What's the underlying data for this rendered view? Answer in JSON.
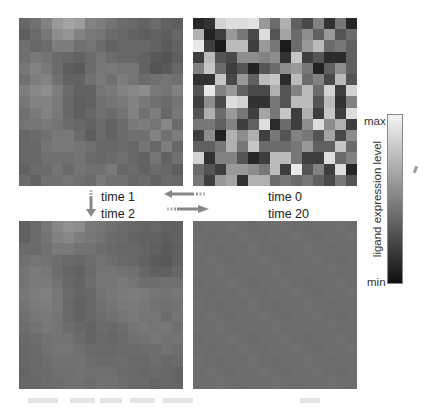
{
  "figure": {
    "panels": [
      {
        "id": "t1",
        "label": "time 1",
        "position": "top-left"
      },
      {
        "id": "t0",
        "label": "time 0",
        "position": "top-right"
      },
      {
        "id": "t2",
        "label": "time 2",
        "position": "bottom-left"
      },
      {
        "id": "t20",
        "label": "time 20",
        "position": "bottom-right"
      }
    ],
    "labels": {
      "t1": "time 1",
      "t0": "time 0",
      "t2": "time 2",
      "t20": "time 20"
    },
    "arrows": [
      {
        "from": "time 0",
        "to": "time 1",
        "direction": "left"
      },
      {
        "from": "time 1",
        "to": "time 2",
        "direction": "down"
      },
      {
        "from": "time 2",
        "to": "time 20",
        "direction": "right"
      }
    ],
    "colorbar": {
      "title": "ligand expression level",
      "max_label": "max",
      "min_label": "min",
      "colormap": "grayscale",
      "max_color": "#f4f4f4",
      "min_color": "#101010"
    },
    "grid_size": [
      15,
      15
    ],
    "grids": {
      "t0": [
        [
          0.1,
          0.15,
          0.85,
          0.9,
          0.9,
          0.92,
          0.6,
          0.4,
          0.7,
          0.35,
          0.25,
          0.5,
          0.15,
          0.45,
          0.1
        ],
        [
          0.7,
          0.08,
          0.2,
          0.6,
          0.45,
          0.25,
          0.9,
          0.3,
          0.65,
          0.4,
          0.55,
          0.35,
          0.6,
          0.3,
          0.4
        ],
        [
          0.95,
          0.2,
          0.05,
          0.75,
          0.75,
          0.2,
          0.6,
          0.45,
          0.05,
          0.4,
          0.6,
          0.75,
          0.4,
          0.45,
          0.35
        ],
        [
          0.2,
          0.75,
          0.3,
          0.25,
          0.55,
          0.55,
          0.5,
          0.55,
          0.15,
          0.8,
          0.2,
          0.3,
          0.12,
          0.12,
          0.35
        ],
        [
          0.5,
          0.8,
          0.4,
          0.2,
          0.3,
          0.08,
          0.3,
          0.4,
          0.55,
          0.6,
          0.45,
          0.08,
          0.35,
          0.55,
          0.35
        ],
        [
          0.15,
          0.15,
          0.8,
          0.25,
          0.6,
          0.35,
          0.75,
          0.8,
          0.12,
          0.75,
          0.4,
          0.5,
          0.25,
          0.75,
          0.3
        ],
        [
          0.3,
          0.95,
          0.5,
          0.6,
          0.35,
          0.25,
          0.25,
          0.7,
          0.3,
          0.5,
          0.75,
          0.4,
          0.85,
          0.2,
          0.85
        ],
        [
          0.2,
          0.55,
          0.25,
          0.9,
          0.85,
          0.15,
          0.15,
          0.45,
          0.3,
          0.75,
          0.75,
          0.3,
          0.75,
          0.15,
          0.5
        ],
        [
          0.3,
          0.7,
          0.4,
          0.6,
          0.45,
          0.2,
          0.65,
          0.45,
          0.8,
          0.2,
          0.7,
          0.2,
          0.8,
          0.2,
          0.9
        ],
        [
          0.45,
          0.45,
          0.35,
          0.5,
          0.2,
          0.35,
          0.9,
          0.12,
          0.4,
          0.2,
          0.55,
          0.9,
          0.55,
          0.7,
          0.2
        ],
        [
          0.2,
          0.55,
          0.08,
          0.7,
          0.55,
          0.7,
          0.2,
          0.45,
          0.3,
          0.5,
          0.45,
          0.3,
          0.65,
          0.25,
          0.55
        ],
        [
          0.35,
          0.35,
          0.45,
          0.7,
          0.45,
          0.8,
          0.4,
          0.4,
          0.4,
          0.45,
          0.6,
          0.35,
          0.35,
          0.8,
          0.4
        ],
        [
          0.85,
          0.15,
          0.5,
          0.5,
          0.3,
          0.1,
          0.2,
          0.75,
          0.75,
          0.45,
          0.2,
          0.2,
          0.9,
          0.4,
          0.5
        ],
        [
          0.4,
          0.3,
          0.2,
          0.6,
          0.6,
          0.55,
          0.45,
          0.75,
          0.2,
          0.95,
          0.3,
          0.5,
          0.2,
          0.9,
          0.1
        ],
        [
          0.45,
          0.2,
          0.6,
          0.65,
          0.15,
          0.7,
          0.7,
          0.4,
          0.45,
          0.4,
          0.45,
          0.35,
          0.25,
          0.45,
          0.3
        ]
      ],
      "t1": [
        [
          0.38,
          0.42,
          0.5,
          0.6,
          0.65,
          0.62,
          0.5,
          0.48,
          0.44,
          0.4,
          0.38,
          0.36,
          0.4,
          0.36,
          0.34
        ],
        [
          0.34,
          0.4,
          0.45,
          0.55,
          0.58,
          0.5,
          0.46,
          0.44,
          0.4,
          0.38,
          0.36,
          0.34,
          0.36,
          0.34,
          0.38
        ],
        [
          0.42,
          0.38,
          0.4,
          0.48,
          0.48,
          0.42,
          0.44,
          0.4,
          0.36,
          0.38,
          0.38,
          0.38,
          0.36,
          0.33,
          0.36
        ],
        [
          0.42,
          0.46,
          0.44,
          0.4,
          0.38,
          0.36,
          0.4,
          0.44,
          0.4,
          0.38,
          0.38,
          0.36,
          0.32,
          0.3,
          0.34
        ],
        [
          0.45,
          0.5,
          0.46,
          0.4,
          0.34,
          0.32,
          0.4,
          0.45,
          0.46,
          0.44,
          0.44,
          0.36,
          0.3,
          0.32,
          0.38
        ],
        [
          0.42,
          0.48,
          0.5,
          0.42,
          0.36,
          0.36,
          0.42,
          0.46,
          0.42,
          0.48,
          0.44,
          0.4,
          0.42,
          0.44,
          0.42
        ],
        [
          0.48,
          0.52,
          0.55,
          0.48,
          0.4,
          0.36,
          0.36,
          0.44,
          0.46,
          0.5,
          0.52,
          0.55,
          0.46,
          0.44,
          0.5
        ],
        [
          0.45,
          0.5,
          0.5,
          0.46,
          0.38,
          0.34,
          0.36,
          0.42,
          0.44,
          0.46,
          0.5,
          0.46,
          0.42,
          0.4,
          0.44
        ],
        [
          0.42,
          0.46,
          0.5,
          0.46,
          0.38,
          0.34,
          0.38,
          0.42,
          0.4,
          0.44,
          0.5,
          0.42,
          0.48,
          0.38,
          0.46
        ],
        [
          0.44,
          0.44,
          0.46,
          0.44,
          0.4,
          0.38,
          0.36,
          0.4,
          0.36,
          0.4,
          0.46,
          0.48,
          0.44,
          0.52,
          0.4
        ],
        [
          0.38,
          0.4,
          0.42,
          0.46,
          0.46,
          0.4,
          0.34,
          0.4,
          0.36,
          0.4,
          0.42,
          0.42,
          0.5,
          0.42,
          0.48
        ],
        [
          0.38,
          0.38,
          0.44,
          0.46,
          0.46,
          0.44,
          0.42,
          0.38,
          0.38,
          0.4,
          0.38,
          0.44,
          0.38,
          0.48,
          0.38
        ],
        [
          0.38,
          0.38,
          0.42,
          0.42,
          0.42,
          0.44,
          0.4,
          0.38,
          0.4,
          0.42,
          0.38,
          0.36,
          0.44,
          0.36,
          0.42
        ],
        [
          0.36,
          0.4,
          0.4,
          0.44,
          0.4,
          0.44,
          0.42,
          0.42,
          0.46,
          0.38,
          0.4,
          0.36,
          0.4,
          0.38,
          0.34
        ],
        [
          0.4,
          0.36,
          0.42,
          0.42,
          0.44,
          0.42,
          0.4,
          0.46,
          0.42,
          0.42,
          0.38,
          0.4,
          0.36,
          0.4,
          0.38
        ]
      ],
      "t2": [
        [
          0.36,
          0.4,
          0.45,
          0.52,
          0.56,
          0.54,
          0.46,
          0.44,
          0.42,
          0.4,
          0.38,
          0.37,
          0.38,
          0.36,
          0.35
        ],
        [
          0.36,
          0.4,
          0.44,
          0.5,
          0.52,
          0.48,
          0.45,
          0.43,
          0.4,
          0.39,
          0.37,
          0.36,
          0.36,
          0.34,
          0.36
        ],
        [
          0.4,
          0.4,
          0.42,
          0.46,
          0.46,
          0.43,
          0.43,
          0.41,
          0.39,
          0.38,
          0.38,
          0.37,
          0.35,
          0.33,
          0.35
        ],
        [
          0.42,
          0.44,
          0.43,
          0.41,
          0.39,
          0.38,
          0.41,
          0.43,
          0.41,
          0.39,
          0.38,
          0.36,
          0.33,
          0.32,
          0.35
        ],
        [
          0.44,
          0.47,
          0.45,
          0.41,
          0.37,
          0.36,
          0.4,
          0.44,
          0.44,
          0.43,
          0.42,
          0.38,
          0.35,
          0.35,
          0.38
        ],
        [
          0.44,
          0.47,
          0.47,
          0.43,
          0.38,
          0.37,
          0.41,
          0.44,
          0.44,
          0.46,
          0.44,
          0.41,
          0.41,
          0.42,
          0.42
        ],
        [
          0.45,
          0.48,
          0.49,
          0.45,
          0.4,
          0.37,
          0.38,
          0.43,
          0.45,
          0.47,
          0.48,
          0.47,
          0.44,
          0.43,
          0.45
        ],
        [
          0.44,
          0.47,
          0.48,
          0.45,
          0.39,
          0.36,
          0.38,
          0.42,
          0.44,
          0.46,
          0.47,
          0.45,
          0.43,
          0.42,
          0.43
        ],
        [
          0.42,
          0.45,
          0.46,
          0.44,
          0.39,
          0.36,
          0.38,
          0.41,
          0.42,
          0.44,
          0.46,
          0.44,
          0.44,
          0.41,
          0.44
        ],
        [
          0.41,
          0.43,
          0.45,
          0.44,
          0.41,
          0.38,
          0.37,
          0.4,
          0.39,
          0.41,
          0.44,
          0.45,
          0.44,
          0.45,
          0.42
        ],
        [
          0.39,
          0.41,
          0.43,
          0.44,
          0.43,
          0.4,
          0.37,
          0.39,
          0.38,
          0.4,
          0.42,
          0.43,
          0.45,
          0.43,
          0.44
        ],
        [
          0.38,
          0.39,
          0.42,
          0.44,
          0.44,
          0.42,
          0.4,
          0.39,
          0.39,
          0.4,
          0.4,
          0.41,
          0.41,
          0.43,
          0.41
        ],
        [
          0.38,
          0.39,
          0.41,
          0.43,
          0.43,
          0.43,
          0.41,
          0.4,
          0.4,
          0.41,
          0.39,
          0.39,
          0.41,
          0.39,
          0.4
        ],
        [
          0.37,
          0.39,
          0.4,
          0.42,
          0.42,
          0.43,
          0.42,
          0.42,
          0.42,
          0.4,
          0.39,
          0.38,
          0.39,
          0.38,
          0.37
        ],
        [
          0.38,
          0.38,
          0.4,
          0.41,
          0.42,
          0.42,
          0.41,
          0.43,
          0.42,
          0.41,
          0.39,
          0.39,
          0.37,
          0.38,
          0.37
        ]
      ],
      "t20_uniform": 0.41
    }
  }
}
